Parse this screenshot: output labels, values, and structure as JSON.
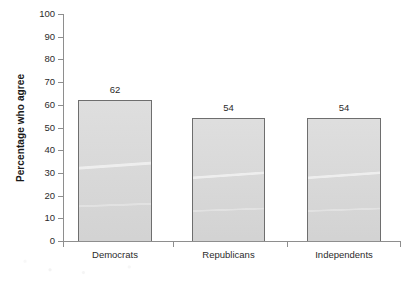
{
  "chart_data": {
    "type": "bar",
    "title": "",
    "xlabel": "",
    "ylabel": "Percentage who agree",
    "categories": [
      "Democrats",
      "Republicans",
      "Independents"
    ],
    "values": [
      62,
      54,
      54
    ],
    "value_labels": [
      "62",
      "54",
      "54"
    ],
    "ylim": [
      0,
      100
    ],
    "ytick_step": 10,
    "yticks": [
      100,
      90,
      80,
      70,
      60,
      50,
      40,
      30,
      20,
      10,
      0
    ],
    "ytick_labels": [
      "100",
      "90",
      "80",
      "70",
      "60",
      "50",
      "40",
      "30",
      "20",
      "10",
      "0"
    ],
    "grid": false,
    "legend": "none",
    "bar_fill_color": "#d7d7d7",
    "bar_border_color": "#6e6e6e",
    "axis_color": "#8e8e8e",
    "text_color": "#2b2b2b",
    "background_color": "#ffffff"
  }
}
